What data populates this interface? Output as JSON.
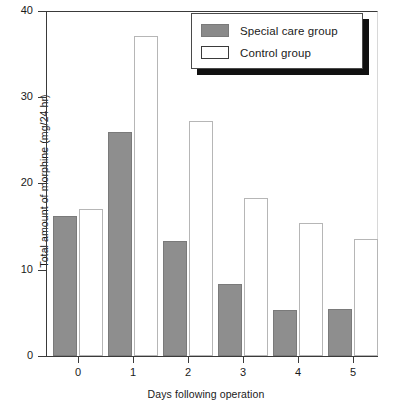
{
  "chart_data": {
    "type": "bar",
    "title": "",
    "xlabel": "Days following operation",
    "ylabel": "Total amount of morphine (mg/24 hr)",
    "categories": [
      "0",
      "1",
      "2",
      "3",
      "4",
      "5"
    ],
    "series": [
      {
        "name": "Special care group",
        "values": [
          16.2,
          26.0,
          13.3,
          8.3,
          5.3,
          5.4
        ],
        "color": "#8e8e8e"
      },
      {
        "name": "Control group",
        "values": [
          17.0,
          37.1,
          27.2,
          18.3,
          15.4,
          13.6
        ],
        "color": "#ffffff"
      }
    ],
    "ylim": [
      0,
      40
    ],
    "yticks": [
      0,
      10,
      20,
      30,
      40
    ],
    "ytick_labels": [
      "0",
      "10",
      "20",
      "30",
      "40"
    ],
    "xtick_labels": [
      "0",
      "1",
      "2",
      "3",
      "4",
      "5"
    ],
    "grid": false,
    "legend_position": "top-right"
  },
  "legend": {
    "entries": [
      {
        "label": "Special care group",
        "swatch": "filled-gray"
      },
      {
        "label": "Control group",
        "swatch": "open-white"
      }
    ]
  },
  "axes": {
    "y_label": "Total amount of morphine (mg/24 hr)",
    "x_label": "Days following operation",
    "y_ticks": [
      "40",
      "30",
      "20",
      "10",
      "0"
    ],
    "x_ticks": [
      "0",
      "1",
      "2",
      "3",
      "4",
      "5"
    ]
  }
}
